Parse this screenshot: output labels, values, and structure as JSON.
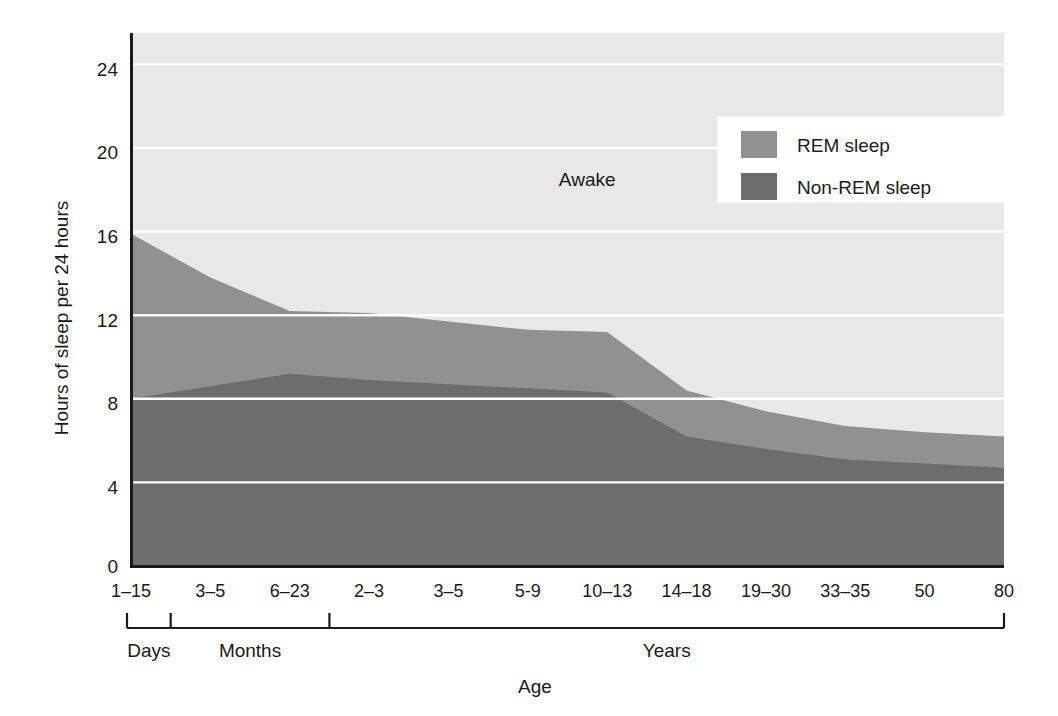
{
  "chart_data": {
    "type": "area",
    "title": "",
    "xlabel": "Age",
    "ylabel": "Hours of sleep per 24 hours",
    "ylim": [
      0,
      25.5
    ],
    "yticks": [
      0,
      4,
      8,
      12,
      16,
      20,
      24
    ],
    "grid": true,
    "legend_position": "top-right",
    "stacked": true,
    "categories": [
      "1–15",
      "3–5",
      "6–23",
      "2–3",
      "3–5",
      "5-9",
      "10–13",
      "14–18",
      "19–30",
      "33–35",
      "50",
      "80"
    ],
    "series": [
      {
        "name": "Non-REM sleep",
        "color": "#6d6d6d",
        "values": [
          8.0,
          8.6,
          9.2,
          8.9,
          8.7,
          8.5,
          8.3,
          6.2,
          5.6,
          5.1,
          4.9,
          4.7
        ]
      },
      {
        "name": "REM sleep",
        "color": "#919191",
        "values": [
          7.9,
          5.2,
          3.0,
          3.2,
          3.0,
          2.8,
          2.9,
          2.2,
          1.8,
          1.6,
          1.5,
          1.5
        ]
      },
      {
        "name": "Awake",
        "color": "#e8e8e8",
        "values": [
          8.1,
          10.2,
          11.8,
          11.9,
          12.3,
          12.7,
          12.8,
          15.6,
          16.6,
          17.3,
          17.6,
          17.8
        ]
      }
    ],
    "total_sleep": [
      15.9,
      13.8,
      12.2,
      12.1,
      11.7,
      11.3,
      11.2,
      8.4,
      7.4,
      6.7,
      6.4,
      6.2
    ],
    "annotations": [
      {
        "text": "Awake",
        "x_category_index": 6,
        "y_value": 18.2
      }
    ],
    "legend": [
      {
        "label": "REM sleep",
        "color": "#919191"
      },
      {
        "label": "Non-REM sleep",
        "color": "#6d6d6d"
      }
    ],
    "x_group_brackets": [
      {
        "label": "Days",
        "start_index": 0,
        "end_index": 0
      },
      {
        "label": "Months",
        "start_index": 1,
        "end_index": 2
      },
      {
        "label": "Years",
        "start_index": 3,
        "end_index": 11
      }
    ]
  },
  "axis": {
    "y_tick_0": "0",
    "y_tick_4": "4",
    "y_tick_8": "8",
    "y_tick_12": "12",
    "y_tick_16": "16",
    "y_tick_20": "20",
    "y_tick_24": "24"
  }
}
